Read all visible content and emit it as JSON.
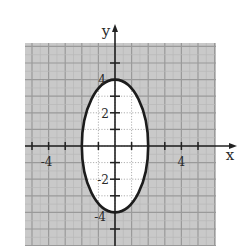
{
  "chart_data": {
    "type": "line",
    "title": "",
    "xlabel": "x",
    "ylabel": "y",
    "xlim": [
      -5.4,
      6.1
    ],
    "ylim": [
      -6.0,
      6.2
    ],
    "grid": true,
    "x_tick_labels": [
      "-4",
      "4"
    ],
    "y_tick_labels": [
      "4",
      "2",
      "-2",
      "-4"
    ],
    "x_ticks": [
      -5,
      -4,
      -3,
      -2,
      -1,
      1,
      2,
      3,
      4,
      5
    ],
    "y_ticks": [
      -5,
      -4,
      -3,
      -2,
      -1,
      1,
      2,
      3,
      4,
      5
    ],
    "series": [
      {
        "name": "ellipse x^2/4 + y^2/16 = 1",
        "shape": "ellipse",
        "center": [
          0,
          0
        ],
        "semi_axis_x": 2,
        "semi_axis_y": 4,
        "points": [
          [
            0,
            4
          ],
          [
            2,
            0
          ],
          [
            0,
            -4
          ],
          [
            -2,
            0
          ]
        ],
        "interior_fill": "white"
      }
    ],
    "legend": null
  },
  "colors": {
    "grid_background": "#c9c9c9",
    "grid_line": "#a9a9a9",
    "axis": "#222222",
    "curve": "#1c1c1c",
    "interior": "#ffffff"
  },
  "axes": {
    "x_label": "x",
    "y_label": "y",
    "labels": {
      "x_neg4": "-4",
      "x_pos4": "4",
      "y_pos4": "4",
      "y_pos2": "2",
      "y_neg2": "-2",
      "y_neg4": "-4"
    }
  }
}
